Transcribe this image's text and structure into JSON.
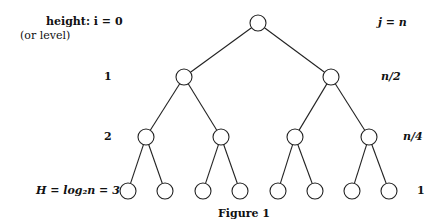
{
  "figure": {
    "caption": "Figure 1",
    "left_header": {
      "line1": "height: i = 0",
      "line2": "(or level)"
    },
    "right_header": "j = n",
    "levels": [
      {
        "left": "height: i = 0",
        "right": "j = n",
        "y": 23,
        "nodes_x": [
          258
        ]
      },
      {
        "left": "1",
        "right": "n/2",
        "y": 77,
        "nodes_x": [
          184,
          331
        ]
      },
      {
        "left": "2",
        "right": "n/4",
        "y": 137,
        "nodes_x": [
          146,
          221,
          295,
          369
        ]
      },
      {
        "left": "H = log₂n = 3",
        "right": "1",
        "y": 191,
        "nodes_x": [
          128,
          165,
          203,
          240,
          278,
          315,
          352,
          389
        ]
      }
    ],
    "node_radius": 8,
    "line_color": "#222222"
  }
}
